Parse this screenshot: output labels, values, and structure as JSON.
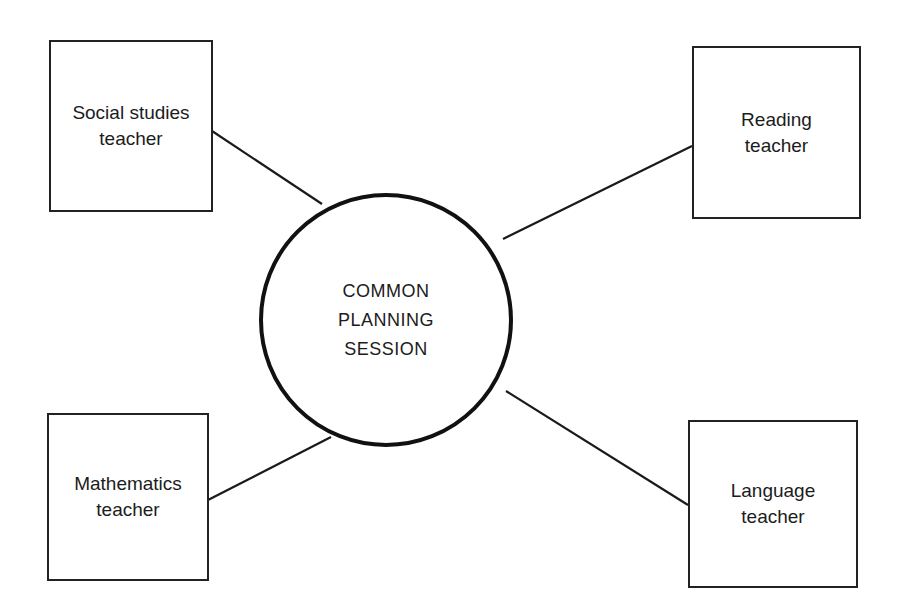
{
  "diagram": {
    "type": "hub-and-spoke",
    "center": {
      "id": "center",
      "label": "COMMON\nPLANNING\nSESSION",
      "shape": "circle",
      "cx": 386,
      "cy": 320,
      "r": 127
    },
    "nodes": [
      {
        "id": "social",
        "label": "Social studies\nteacher",
        "shape": "rect",
        "x": 49,
        "y": 40,
        "w": 164,
        "h": 172
      },
      {
        "id": "reading",
        "label": "Reading\nteacher",
        "shape": "rect",
        "x": 692,
        "y": 46,
        "w": 169,
        "h": 173
      },
      {
        "id": "math",
        "label": "Mathematics\nteacher",
        "shape": "rect",
        "x": 47,
        "y": 413,
        "w": 162,
        "h": 168
      },
      {
        "id": "language",
        "label": "Language\nteacher",
        "shape": "rect",
        "x": 688,
        "y": 420,
        "w": 170,
        "h": 168
      }
    ],
    "edges": [
      {
        "from": "social",
        "to": "center",
        "x1": 212,
        "y1": 131,
        "x2": 322,
        "y2": 204
      },
      {
        "from": "reading",
        "to": "center",
        "x1": 692,
        "y1": 146,
        "x2": 503,
        "y2": 239
      },
      {
        "from": "math",
        "to": "center",
        "x1": 208,
        "y1": 500,
        "x2": 331,
        "y2": 437
      },
      {
        "from": "language",
        "to": "center",
        "x1": 688,
        "y1": 505,
        "x2": 506,
        "y2": 391
      }
    ],
    "colors": {
      "stroke": "#1a1a1a",
      "background": "#ffffff",
      "text": "#1c1c1c"
    }
  }
}
